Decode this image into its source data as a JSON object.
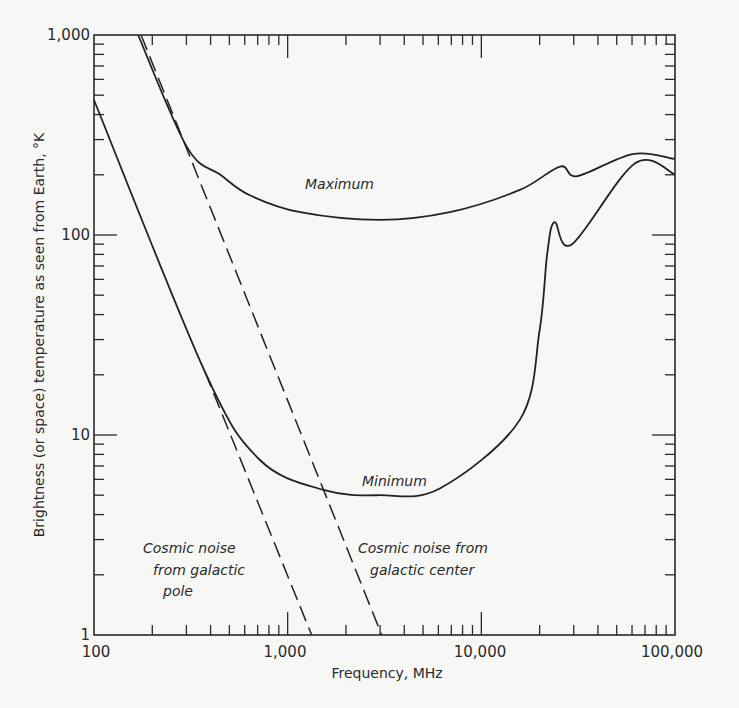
{
  "chart_data": {
    "type": "line",
    "title": "",
    "xlabel": "Frequency, MHz",
    "ylabel": "Brightness (or space) temperature as seen from Earth, °K",
    "xscale": "log",
    "yscale": "log",
    "xlim": [
      100,
      100000
    ],
    "ylim": [
      1,
      1000
    ],
    "grid": false,
    "legend": "none (inline annotations)",
    "x_ticks": [
      100,
      1000,
      10000,
      100000
    ],
    "x_tick_labels": [
      "100",
      "1,000",
      "10,000",
      "100,000"
    ],
    "y_ticks": [
      1,
      10,
      100,
      1000
    ],
    "y_tick_labels": [
      "1",
      "10",
      "100",
      "1,000"
    ],
    "series": [
      {
        "name": "Maximum",
        "style": "solid",
        "x": [
          169,
          302,
          450,
          638,
          1160,
          3000,
          6870,
          15800,
          25500,
          31300,
          60500,
          100000
        ],
        "y": [
          1000,
          275,
          200,
          158,
          130,
          119,
          130,
          168,
          220,
          197,
          254,
          240
        ]
      },
      {
        "name": "Minimum",
        "style": "solid",
        "x": [
          100,
          374,
          719,
          1550,
          2980,
          6100,
          15800,
          20000,
          21900,
          23900,
          29400,
          62000,
          100000
        ],
        "y": [
          473,
          20.7,
          7.5,
          5.3,
          5.0,
          5.4,
          11.9,
          33.5,
          81,
          116,
          90,
          228,
          201
        ]
      },
      {
        "name": "Cosmic noise from galactic pole",
        "style": "dashed",
        "x": [
          374,
          1330
        ],
        "y": [
          20.7,
          1
        ]
      },
      {
        "name": "Cosmic noise from galactic center",
        "style": "dashed",
        "x": [
          175,
          3060
        ],
        "y": [
          1000,
          1
        ]
      }
    ],
    "annotations": [
      {
        "text": "Maximum",
        "near": "upper curve, ~1,500 MHz"
      },
      {
        "text": "Minimum",
        "near": "lower curve, ~3,000 MHz"
      },
      {
        "text": [
          "Cosmic noise",
          "from galactic",
          "pole"
        ],
        "near": "left dashed line"
      },
      {
        "text": [
          "Cosmic noise from",
          "galactic center"
        ],
        "near": "right dashed line"
      }
    ]
  },
  "labels": {
    "x_axis_title": "Frequency, MHz",
    "y_axis_title": "Brightness (or space) temperature as seen from Earth, °K",
    "x_ticks": [
      "100",
      "1,000",
      "10,000",
      "100,000"
    ],
    "y_ticks": [
      "1,000",
      "100",
      "10",
      "1"
    ],
    "maximum": "Maximum",
    "minimum": "Minimum",
    "pole_line1": "Cosmic noise",
    "pole_line2": "from galactic",
    "pole_line3": "pole",
    "center_line1": "Cosmic noise from",
    "center_line2": "galactic center"
  },
  "colors": {
    "background": "#f7f7f5",
    "ink": "#2a2a2a"
  }
}
